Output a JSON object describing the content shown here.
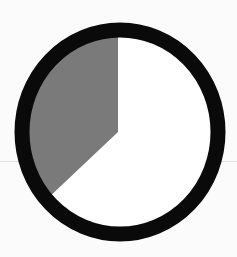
{
  "figure": {
    "type": "circle-sector-diagram",
    "center": {
      "x": 120,
      "y": 132
    },
    "outer_radius_x": 105,
    "outer_radius_y": 109,
    "ring_width": 15,
    "sector": {
      "start_angle_deg": 0,
      "end_angle_deg": -130,
      "direction": "counterclockwise-from-top",
      "fraction": 0.36
    },
    "colors": {
      "ring": "#0a0a0a",
      "sector_fill": "#7a7a7a",
      "background": "#ffffff"
    }
  }
}
